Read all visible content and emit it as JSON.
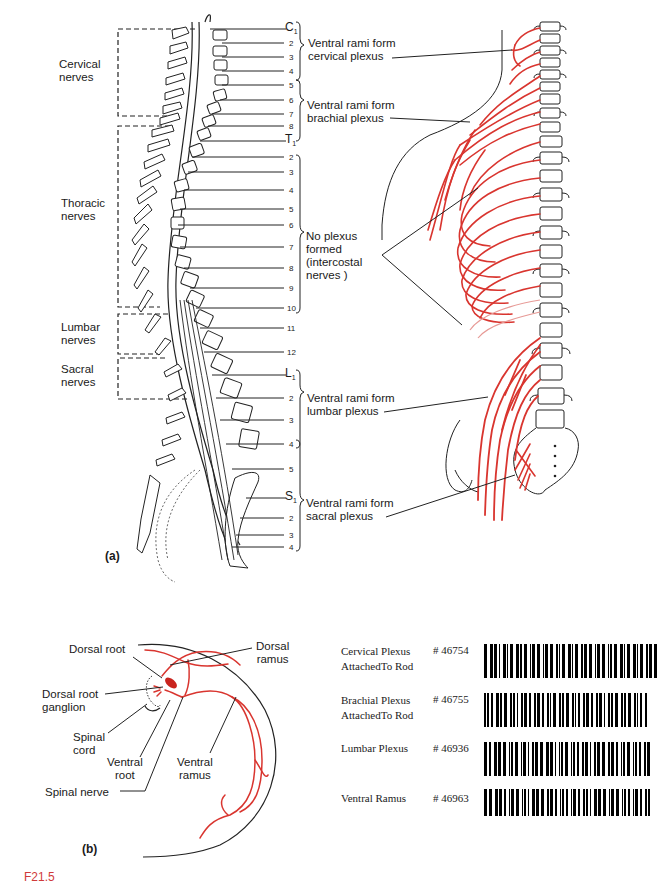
{
  "figure_id": "F21.5",
  "panel_a": {
    "tag": "(a)",
    "region_labels": [
      {
        "line1": "Cervical",
        "line2": "nerves"
      },
      {
        "line1": "Thoracic",
        "line2": "nerves"
      },
      {
        "line1": "Lumbar",
        "line2": "nerves"
      },
      {
        "line1": "Sacral",
        "line2": "nerves"
      }
    ],
    "nerve_numbers": {
      "cervical": [
        "C",
        "2",
        "3",
        "4",
        "5",
        "6",
        "7",
        "8"
      ],
      "thoracic": [
        "T",
        "2",
        "3",
        "4",
        "5",
        "6",
        "7",
        "8",
        "9",
        "10",
        "11",
        "12"
      ],
      "lumbar": [
        "L",
        "2",
        "3",
        "4",
        "5"
      ],
      "sacral": [
        "S",
        "2",
        "3",
        "4"
      ]
    },
    "subscript": "1",
    "plexus_labels": [
      {
        "line1": "Ventral rami form",
        "line2": "cervical plexus"
      },
      {
        "line1": "Ventral rami form",
        "line2": "brachial plexus"
      },
      {
        "line1": "No plexus",
        "line2": "formed",
        "line3": "(intercostal",
        "line4": "nerves )"
      },
      {
        "line1": "Ventral rami form",
        "line2": "lumbar plexus"
      },
      {
        "line1": "Ventral rami form",
        "line2": "sacral plexus"
      }
    ]
  },
  "panel_b": {
    "tag": "(b)",
    "labels": {
      "dorsal_root": "Dorsal root",
      "dorsal_ramus_1": "Dorsal",
      "dorsal_ramus_2": "ramus",
      "drg_1": "Dorsal root",
      "drg_2": "ganglion",
      "spinal_cord_1": "Spinal",
      "spinal_cord_2": "cord",
      "ventral_root_1": "Ventral",
      "ventral_root_2": "root",
      "ventral_ramus_1": "Ventral",
      "ventral_ramus_2": "ramus",
      "spinal_nerve": "Spinal nerve"
    }
  },
  "barcode_list": [
    {
      "name": "Cervical Plexus",
      "sub": "AttachedTo Rod",
      "code": "# 46754"
    },
    {
      "name": "Brachial Plexus",
      "sub": "AttachedTo Rod",
      "code": "# 46755"
    },
    {
      "name": "Lumbar Plexus",
      "sub": "",
      "code": "# 46936"
    },
    {
      "name": "Ventral Ramus",
      "sub": "",
      "code": "# 46963"
    }
  ],
  "colors": {
    "nerve_red": "#d9352f",
    "ink": "#1a1a1a",
    "figure_id": "#d03a3a"
  }
}
